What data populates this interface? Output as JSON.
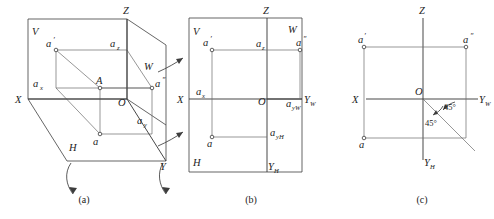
{
  "figure": {
    "background_color": "#ffffff",
    "line_color": "#4a4a4a",
    "text_color": "#1c1c1c"
  },
  "panels": [
    {
      "id": "a",
      "caption": "(a)",
      "description": "Three mutually perpendicular projection planes V, H, W in pictorial view with point A and its projections",
      "labels": {
        "plane_v": "V",
        "plane_h": "H",
        "plane_w": "W",
        "axis_x": "X",
        "axis_y": "Y",
        "axis_z": "Z",
        "origin": "O",
        "point_space": "A",
        "proj_front": "a",
        "proj_front_prime": "′",
        "proj_side": "a",
        "proj_side_dprime": "″",
        "proj_top": "a",
        "foot_x": "a",
        "foot_x_sub": "x",
        "foot_y": "a",
        "foot_y_sub": "y",
        "foot_z": "a",
        "foot_z_sub": "z"
      }
    },
    {
      "id": "b",
      "caption": "(b)",
      "description": "Projection planes unfolded into one plane, frame still shown",
      "labels": {
        "plane_v": "V",
        "plane_h": "H",
        "plane_w": "W",
        "axis_x": "X",
        "axis_z": "Z",
        "axis_yw": "Y",
        "axis_yw_sub": "W",
        "axis_yh": "Y",
        "axis_yh_sub": "H",
        "origin": "O",
        "proj_front": "a",
        "proj_front_prime": "′",
        "proj_side": "a",
        "proj_side_dprime": "″",
        "proj_top": "a",
        "foot_x": "a",
        "foot_x_sub": "x",
        "foot_z": "a",
        "foot_z_sub": "z",
        "foot_yw": "a",
        "foot_yw_sub": "yW",
        "foot_yh": "a",
        "foot_yh_sub": "yH"
      }
    },
    {
      "id": "c",
      "caption": "(c)",
      "description": "Final three-view drawing with 45 degree mitre line through origin",
      "labels": {
        "axis_x": "X",
        "axis_z": "Z",
        "axis_yw": "Y",
        "axis_yw_sub": "W",
        "axis_yh": "Y",
        "axis_yh_sub": "H",
        "origin": "O",
        "proj_front": "a",
        "proj_front_prime": "′",
        "proj_side": "a",
        "proj_side_dprime": "″",
        "proj_top": "a",
        "angle_upper": "45°",
        "angle_lower": "45°"
      }
    }
  ]
}
